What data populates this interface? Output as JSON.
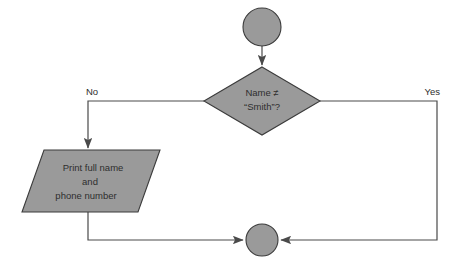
{
  "diagram": {
    "type": "flowchart",
    "canvas": {
      "width": 451,
      "height": 272,
      "background": "#ffffff"
    },
    "style": {
      "shape_fill": "#9a9a9a",
      "shape_border": "#3b3b3b",
      "connector_color": "#4a4a4a",
      "text_color": "#2e2e2e"
    },
    "nodes": {
      "start": {
        "shape": "circle",
        "semantic": "connector-start",
        "label": "",
        "cx": 262,
        "cy": 27,
        "r": 19
      },
      "decision": {
        "shape": "diamond",
        "semantic": "decision",
        "line1": "Name ≠",
        "line2": "“Smith”?",
        "cx": 262,
        "cy": 101,
        "half_width": 58,
        "half_height": 34
      },
      "output": {
        "shape": "parallelogram",
        "semantic": "input-output",
        "line1": "Print full name",
        "line2": "and",
        "line3": "phone number",
        "cx": 91,
        "cy": 181,
        "width": 138,
        "height": 62,
        "skew": 22
      },
      "end": {
        "shape": "circle",
        "semantic": "connector-end",
        "label": "",
        "cx": 262,
        "cy": 240,
        "r": 16
      }
    },
    "edges": [
      {
        "name": "start-to-decision",
        "from": "start",
        "to": "decision",
        "label": "",
        "arrow": true
      },
      {
        "name": "decision-no-to-output",
        "from": "decision",
        "to": "output",
        "label": "No",
        "label_x": 86,
        "label_y": 92,
        "arrow": true
      },
      {
        "name": "decision-yes-to-end",
        "from": "decision",
        "to": "end",
        "label": "Yes",
        "label_x": 437,
        "label_y": 92,
        "arrow": true
      },
      {
        "name": "output-to-end",
        "from": "output",
        "to": "end",
        "label": "",
        "arrow": true
      }
    ]
  }
}
